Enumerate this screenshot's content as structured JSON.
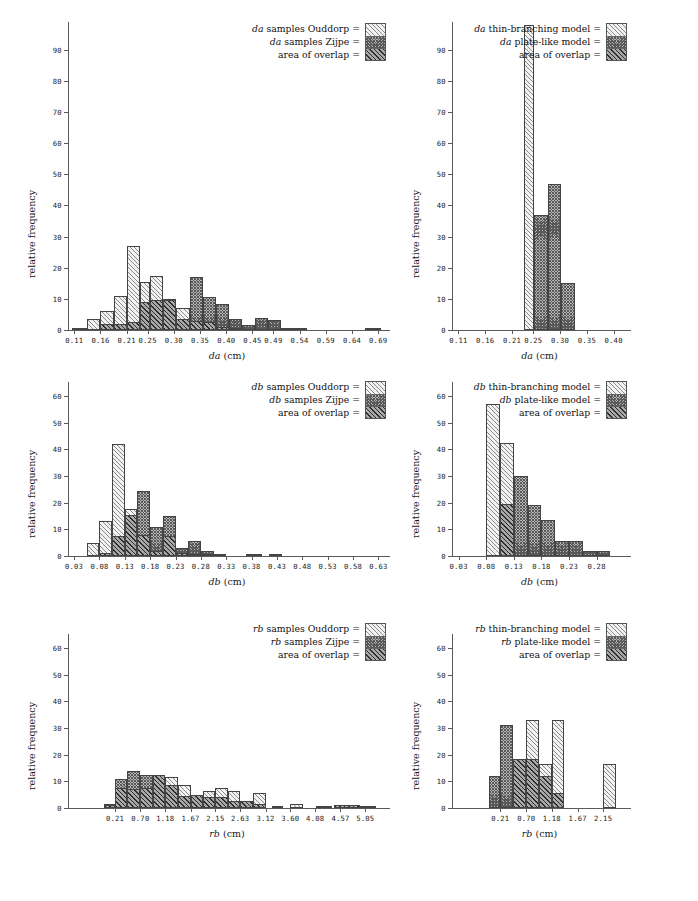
{
  "figure": {
    "panel_count": 6,
    "y_axis_title": "relative frequency",
    "units": "cm"
  },
  "chart_data": [
    {
      "id": "panel-da-samples",
      "type": "bar",
      "position": "top-left",
      "title": "",
      "xlabel": "da (cm)",
      "xlabel_italic": "da",
      "xlabel_rest": " (cm)",
      "ylabel": "relative frequency",
      "ylim": [
        0,
        97
      ],
      "yticks": [
        0,
        10,
        20,
        30,
        40,
        50,
        60,
        70,
        80,
        90
      ],
      "xticks": [
        "0.11",
        "0.16",
        "0.21",
        "0.25",
        "0.30",
        "0.35",
        "0.40",
        "0.45",
        "0.49",
        "0.54",
        "0.59",
        "0.64",
        "0.69"
      ],
      "grid": false,
      "legend_position": "top-right",
      "legend": [
        {
          "label": "da samples Ouddorp =",
          "italic": "da",
          "rest": " samples Ouddorp =",
          "pattern": "light"
        },
        {
          "label": "da samples Zijpe =",
          "italic": "da",
          "rest": " samples Zijpe =",
          "pattern": "dark"
        },
        {
          "label": "area of overlap =",
          "italic": "",
          "rest": "area of overlap =",
          "pattern": "overlap"
        }
      ],
      "bins": [
        {
          "x0": 0.105,
          "x1": 0.135,
          "light": 0.6,
          "dark": 0.0,
          "overlap": 0.0
        },
        {
          "x0": 0.135,
          "x1": 0.16,
          "light": 3.5,
          "dark": 0.0,
          "overlap": 0.0
        },
        {
          "x0": 0.16,
          "x1": 0.185,
          "light": 6.0,
          "dark": 2.0,
          "overlap": 2.0
        },
        {
          "x0": 0.185,
          "x1": 0.21,
          "light": 11.0,
          "dark": 2.0,
          "overlap": 2.0
        },
        {
          "x0": 0.21,
          "x1": 0.235,
          "light": 27.0,
          "dark": 2.5,
          "overlap": 2.5
        },
        {
          "x0": 0.235,
          "x1": 0.255,
          "light": 15.5,
          "dark": 9.0,
          "overlap": 9.0
        },
        {
          "x0": 0.255,
          "x1": 0.28,
          "light": 17.5,
          "dark": 9.5,
          "overlap": 9.5
        },
        {
          "x0": 0.28,
          "x1": 0.305,
          "light": 10.0,
          "dark": 9.5,
          "overlap": 9.5
        },
        {
          "x0": 0.305,
          "x1": 0.33,
          "light": 7.0,
          "dark": 3.5,
          "overlap": 3.5
        },
        {
          "x0": 0.33,
          "x1": 0.355,
          "light": 3.0,
          "dark": 17.0,
          "overlap": 3.0
        },
        {
          "x0": 0.355,
          "x1": 0.38,
          "light": 2.5,
          "dark": 10.5,
          "overlap": 2.5
        },
        {
          "x0": 0.38,
          "x1": 0.405,
          "light": 1.0,
          "dark": 8.5,
          "overlap": 1.0
        },
        {
          "x0": 0.405,
          "x1": 0.43,
          "light": 0.4,
          "dark": 3.5,
          "overlap": 0.4
        },
        {
          "x0": 0.43,
          "x1": 0.455,
          "light": 0.0,
          "dark": 1.5,
          "overlap": 0.0
        },
        {
          "x0": 0.455,
          "x1": 0.48,
          "light": 0.0,
          "dark": 4.0,
          "overlap": 0.0
        },
        {
          "x0": 0.48,
          "x1": 0.505,
          "light": 0.0,
          "dark": 3.3,
          "overlap": 0.0
        },
        {
          "x0": 0.505,
          "x1": 0.53,
          "light": 0.0,
          "dark": 0.6,
          "overlap": 0.0
        },
        {
          "x0": 0.53,
          "x1": 0.555,
          "light": 0.0,
          "dark": 0.7,
          "overlap": 0.0
        },
        {
          "x0": 0.665,
          "x1": 0.695,
          "light": 0.7,
          "dark": 0.7,
          "overlap": 0.7
        }
      ]
    },
    {
      "id": "panel-da-models",
      "type": "bar",
      "position": "top-right",
      "xlabel": "da (cm)",
      "xlabel_italic": "da",
      "xlabel_rest": " (cm)",
      "ylabel": "relative frequency",
      "ylim": [
        0,
        97
      ],
      "yticks": [
        0,
        10,
        20,
        30,
        40,
        50,
        60,
        70,
        80,
        90
      ],
      "xticks": [
        "0.11",
        "0.16",
        "0.21",
        "0.25",
        "0.30",
        "0.35",
        "0.40"
      ],
      "grid": false,
      "legend_position": "top-right",
      "legend": [
        {
          "label": "da thin-branching model =",
          "italic": "da",
          "rest": " thin-branching model =",
          "pattern": "light"
        },
        {
          "label": "da plate-like model =",
          "italic": "da",
          "rest": " plate-like model =",
          "pattern": "dark"
        },
        {
          "label": "area of overlap =",
          "italic": "",
          "rest": "area of overlap =",
          "pattern": "overlap"
        }
      ],
      "bins": [
        {
          "x0": 0.232,
          "x1": 0.252,
          "light": 98.0,
          "dark": 0.0,
          "overlap": 0.0
        },
        {
          "x0": 0.252,
          "x1": 0.277,
          "light": 0.0,
          "dark": 37.0,
          "overlap": 0.0
        },
        {
          "x0": 0.277,
          "x1": 0.302,
          "light": 0.0,
          "dark": 47.0,
          "overlap": 0.0
        },
        {
          "x0": 0.302,
          "x1": 0.327,
          "light": 0.0,
          "dark": 15.0,
          "overlap": 0.0
        }
      ]
    },
    {
      "id": "panel-db-samples",
      "type": "bar",
      "position": "middle-left",
      "xlabel": "db (cm)",
      "xlabel_italic": "db",
      "xlabel_rest": " (cm)",
      "ylabel": "relative frequency",
      "ylim": [
        0,
        63
      ],
      "yticks": [
        0,
        10,
        20,
        30,
        40,
        50,
        60
      ],
      "xticks": [
        "0.03",
        "0.08",
        "0.13",
        "0.18",
        "0.23",
        "0.28",
        "0.33",
        "0.38",
        "0.43",
        "0.48",
        "0.53",
        "0.58",
        "0.63"
      ],
      "grid": false,
      "legend_position": "top-right",
      "legend": [
        {
          "label": "db samples Ouddorp =",
          "italic": "db",
          "rest": " samples Ouddorp =",
          "pattern": "light"
        },
        {
          "label": "db samples Zijpe =",
          "italic": "db",
          "rest": " samples Zijpe =",
          "pattern": "dark"
        },
        {
          "label": "area of overlap =",
          "italic": "",
          "rest": "area of overlap =",
          "pattern": "overlap"
        }
      ],
      "bins": [
        {
          "x0": 0.055,
          "x1": 0.08,
          "light": 5.0,
          "dark": 0.0,
          "overlap": 0.0
        },
        {
          "x0": 0.08,
          "x1": 0.105,
          "light": 13.0,
          "dark": 1.0,
          "overlap": 1.0
        },
        {
          "x0": 0.105,
          "x1": 0.13,
          "light": 42.0,
          "dark": 7.5,
          "overlap": 7.5
        },
        {
          "x0": 0.13,
          "x1": 0.155,
          "light": 17.5,
          "dark": 15.5,
          "overlap": 15.5
        },
        {
          "x0": 0.155,
          "x1": 0.18,
          "light": 8.0,
          "dark": 24.5,
          "overlap": 8.0
        },
        {
          "x0": 0.18,
          "x1": 0.205,
          "light": 2.0,
          "dark": 11.0,
          "overlap": 2.0
        },
        {
          "x0": 0.205,
          "x1": 0.23,
          "light": 7.5,
          "dark": 15.0,
          "overlap": 7.5
        },
        {
          "x0": 0.23,
          "x1": 0.255,
          "light": 1.0,
          "dark": 3.0,
          "overlap": 1.0
        },
        {
          "x0": 0.255,
          "x1": 0.28,
          "light": 0.6,
          "dark": 5.5,
          "overlap": 0.6
        },
        {
          "x0": 0.28,
          "x1": 0.305,
          "light": 0.3,
          "dark": 2.0,
          "overlap": 0.3
        },
        {
          "x0": 0.305,
          "x1": 0.33,
          "light": 0.0,
          "dark": 0.7,
          "overlap": 0.0
        },
        {
          "x0": 0.368,
          "x1": 0.4,
          "light": 0.6,
          "dark": 0.6,
          "overlap": 0.6
        },
        {
          "x0": 0.415,
          "x1": 0.44,
          "light": 0.6,
          "dark": 0.6,
          "overlap": 0.6
        }
      ]
    },
    {
      "id": "panel-db-models",
      "type": "bar",
      "position": "middle-right",
      "xlabel": "db (cm)",
      "xlabel_italic": "db",
      "xlabel_rest": " (cm)",
      "ylabel": "relative frequency",
      "ylim": [
        0,
        63
      ],
      "yticks": [
        0,
        10,
        20,
        30,
        40,
        50,
        60
      ],
      "xticks": [
        "0.03",
        "0.08",
        "0.13",
        "0.18",
        "0.23",
        "0.28"
      ],
      "grid": false,
      "legend_position": "top-right",
      "legend": [
        {
          "label": "db thin-branching model =",
          "italic": "db",
          "rest": " thin-branching model =",
          "pattern": "light"
        },
        {
          "label": "db plate-like model =",
          "italic": "db",
          "rest": " plate-like model =",
          "pattern": "dark"
        },
        {
          "label": "area of overlap =",
          "italic": "",
          "rest": "area of overlap =",
          "pattern": "overlap"
        }
      ],
      "bins": [
        {
          "x0": 0.08,
          "x1": 0.105,
          "light": 57.0,
          "dark": 0.0,
          "overlap": 0.0
        },
        {
          "x0": 0.105,
          "x1": 0.13,
          "light": 42.5,
          "dark": 19.5,
          "overlap": 19.5
        },
        {
          "x0": 0.13,
          "x1": 0.155,
          "light": 0.0,
          "dark": 30.0,
          "overlap": 0.0
        },
        {
          "x0": 0.155,
          "x1": 0.18,
          "light": 0.0,
          "dark": 19.0,
          "overlap": 0.0
        },
        {
          "x0": 0.18,
          "x1": 0.205,
          "light": 0.0,
          "dark": 13.5,
          "overlap": 0.0
        },
        {
          "x0": 0.205,
          "x1": 0.23,
          "light": 0.0,
          "dark": 5.5,
          "overlap": 0.0
        },
        {
          "x0": 0.23,
          "x1": 0.255,
          "light": 0.0,
          "dark": 5.5,
          "overlap": 0.0
        },
        {
          "x0": 0.255,
          "x1": 0.28,
          "light": 0.0,
          "dark": 2.0,
          "overlap": 0.0
        },
        {
          "x0": 0.28,
          "x1": 0.305,
          "light": 0.0,
          "dark": 2.0,
          "overlap": 0.0
        }
      ]
    },
    {
      "id": "panel-rb-samples",
      "type": "bar",
      "position": "bottom-left",
      "xlabel": "rb (cm)",
      "xlabel_italic": "rb",
      "xlabel_rest": " (cm)",
      "ylabel": "relative frequency",
      "ylim": [
        0,
        63
      ],
      "yticks": [
        0,
        10,
        20,
        30,
        40,
        50,
        60
      ],
      "xticks": [
        "0.21",
        "0.70",
        "1.18",
        "1.67",
        "2.15",
        "2.63",
        "3.12",
        "3.60",
        "4.08",
        "4.57",
        "5.05"
      ],
      "grid": false,
      "legend_position": "top-right",
      "legend": [
        {
          "label": "rb samples Ouddorp =",
          "italic": "rb",
          "rest": " samples Ouddorp =",
          "pattern": "light"
        },
        {
          "label": "rb samples Zijpe =",
          "italic": "rb",
          "rest": " samples Zijpe =",
          "pattern": "dark"
        },
        {
          "label": "area of overlap =",
          "italic": "",
          "rest": "area of overlap =",
          "pattern": "overlap"
        }
      ],
      "bins": [
        {
          "x0": 0.0,
          "x1": 0.21,
          "light": 1.5,
          "dark": 1.5,
          "overlap": 1.0
        },
        {
          "x0": 0.21,
          "x1": 0.45,
          "light": 7.5,
          "dark": 11.0,
          "overlap": 7.5
        },
        {
          "x0": 0.45,
          "x1": 0.7,
          "light": 7.0,
          "dark": 14.0,
          "overlap": 7.0
        },
        {
          "x0": 0.7,
          "x1": 0.94,
          "light": 7.5,
          "dark": 12.5,
          "overlap": 7.5
        },
        {
          "x0": 0.94,
          "x1": 1.18,
          "light": 12.3,
          "dark": 12.5,
          "overlap": 12.3
        },
        {
          "x0": 1.18,
          "x1": 1.42,
          "light": 11.5,
          "dark": 8.5,
          "overlap": 8.5
        },
        {
          "x0": 1.42,
          "x1": 1.67,
          "light": 8.5,
          "dark": 4.5,
          "overlap": 4.5
        },
        {
          "x0": 1.67,
          "x1": 1.91,
          "light": 5.0,
          "dark": 5.0,
          "overlap": 5.0
        },
        {
          "x0": 1.91,
          "x1": 2.15,
          "light": 6.5,
          "dark": 4.0,
          "overlap": 4.0
        },
        {
          "x0": 2.15,
          "x1": 2.39,
          "light": 7.5,
          "dark": 4.0,
          "overlap": 4.0
        },
        {
          "x0": 2.39,
          "x1": 2.63,
          "light": 6.5,
          "dark": 2.5,
          "overlap": 2.5
        },
        {
          "x0": 2.63,
          "x1": 2.87,
          "light": 2.5,
          "dark": 2.5,
          "overlap": 2.5
        },
        {
          "x0": 2.87,
          "x1": 3.12,
          "light": 5.5,
          "dark": 1.5,
          "overlap": 1.5
        },
        {
          "x0": 3.25,
          "x1": 3.45,
          "light": 0.8,
          "dark": 0.8,
          "overlap": 0.8
        },
        {
          "x0": 3.6,
          "x1": 3.85,
          "light": 1.5,
          "dark": 0.0,
          "overlap": 0.0
        },
        {
          "x0": 4.1,
          "x1": 4.4,
          "light": 0.7,
          "dark": 0.7,
          "overlap": 0.7
        },
        {
          "x0": 4.45,
          "x1": 4.95,
          "light": 1.2,
          "dark": 1.2,
          "overlap": 1.2
        },
        {
          "x0": 4.95,
          "x1": 5.25,
          "light": 0.6,
          "dark": 0.0,
          "overlap": 0.0
        }
      ]
    },
    {
      "id": "panel-rb-models",
      "type": "bar",
      "position": "bottom-right",
      "xlabel": "rb (cm)",
      "xlabel_italic": "rb",
      "xlabel_rest": " (cm)",
      "ylabel": "relative frequency",
      "ylim": [
        0,
        63
      ],
      "yticks": [
        0,
        10,
        20,
        30,
        40,
        50,
        60
      ],
      "xticks": [
        "0.21",
        "0.70",
        "1.18",
        "1.67",
        "2.15"
      ],
      "grid": false,
      "legend_position": "top-right",
      "legend": [
        {
          "label": "rb thin-branching model =",
          "italic": "rb",
          "rest": " thin-branching model =",
          "pattern": "light"
        },
        {
          "label": "rb plate-like model =",
          "italic": "rb",
          "rest": " plate-like model =",
          "pattern": "dark"
        },
        {
          "label": "area of overlap =",
          "italic": "",
          "rest": "area of overlap =",
          "pattern": "overlap"
        }
      ],
      "bins": [
        {
          "x0": 0.0,
          "x1": 0.21,
          "light": 0.0,
          "dark": 12.0,
          "overlap": 0.0
        },
        {
          "x0": 0.21,
          "x1": 0.45,
          "light": 0.0,
          "dark": 31.0,
          "overlap": 0.0
        },
        {
          "x0": 0.45,
          "x1": 0.7,
          "light": 18.5,
          "dark": 18.5,
          "overlap": 18.5
        },
        {
          "x0": 0.7,
          "x1": 0.94,
          "light": 33.0,
          "dark": 18.5,
          "overlap": 18.5
        },
        {
          "x0": 0.94,
          "x1": 1.18,
          "light": 16.5,
          "dark": 12.0,
          "overlap": 12.0
        },
        {
          "x0": 1.18,
          "x1": 1.42,
          "light": 33.0,
          "dark": 5.5,
          "overlap": 5.5
        },
        {
          "x0": 2.15,
          "x1": 2.39,
          "light": 16.5,
          "dark": 0.0,
          "overlap": 0.0
        }
      ]
    }
  ]
}
